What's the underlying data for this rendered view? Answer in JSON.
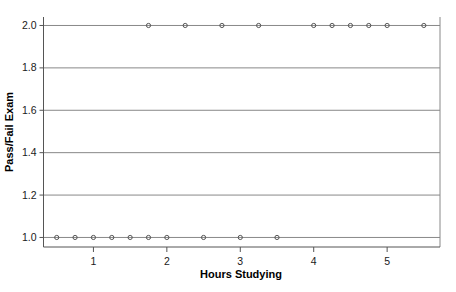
{
  "chart_data": {
    "type": "scatter",
    "title": "",
    "xlabel": "Hours Studying",
    "ylabel": "Pass/Fail Exam",
    "xlim": [
      0.32,
      5.72
    ],
    "ylim": [
      0.955,
      2.04
    ],
    "grid": true,
    "legend": false,
    "marker": "open-circle",
    "marker_color": "#555555",
    "xticks": [
      1,
      2,
      3,
      4,
      5
    ],
    "xtick_labels": [
      "1",
      "2",
      "3",
      "4",
      "5"
    ],
    "yticks": [
      1.0,
      1.2,
      1.4,
      1.6,
      1.8,
      2.0
    ],
    "ytick_labels": [
      "1.0",
      "1.2",
      "1.4",
      "1.6",
      "1.8",
      "2.0"
    ],
    "series": [
      {
        "name": "Exam outcome",
        "x": [
          0.5,
          0.75,
          1.0,
          1.25,
          1.5,
          1.75,
          2.0,
          2.5,
          3.0,
          3.5,
          1.75,
          2.25,
          2.75,
          3.25,
          4.0,
          4.25,
          4.5,
          4.75,
          5.0,
          5.5
        ],
        "y": [
          1.0,
          1.0,
          1.0,
          1.0,
          1.0,
          1.0,
          1.0,
          1.0,
          1.0,
          1.0,
          2.0,
          2.0,
          2.0,
          2.0,
          2.0,
          2.0,
          2.0,
          2.0,
          2.0,
          2.0
        ]
      }
    ],
    "points_fail": {
      "label": "Fail (1.0)",
      "x": [
        0.5,
        0.75,
        1.0,
        1.25,
        1.5,
        1.75,
        2.0,
        2.5,
        3.0,
        3.5
      ],
      "y": 1.0
    },
    "points_pass": {
      "label": "Pass (2.0)",
      "x": [
        1.75,
        2.25,
        2.75,
        3.25,
        4.0,
        4.25,
        4.5,
        4.75,
        5.0,
        5.5
      ],
      "y": 2.0
    }
  },
  "colors": {
    "background": "#ffffff",
    "plot_background": "#ffffff",
    "gridline": "#888888",
    "axis_line": "#555555",
    "marker_stroke": "#555555",
    "text": "#1a1a1a"
  }
}
